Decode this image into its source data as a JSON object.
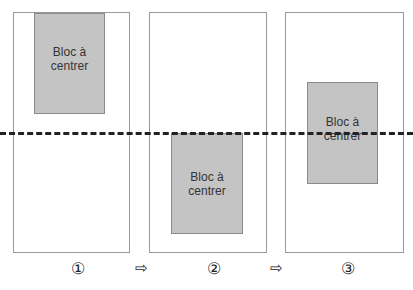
{
  "panels": [
    {
      "step": "①",
      "block_label": "Bloc à\ncentrer"
    },
    {
      "step": "②",
      "block_label": "Bloc à\ncentrer"
    },
    {
      "step": "③",
      "block_label": "Bloc à\ncentrer"
    }
  ],
  "arrows": [
    "⇨",
    "⇨"
  ],
  "colors": {
    "block": "#c4c4c4",
    "border": "#9a9a9a",
    "dash": "#222222"
  }
}
